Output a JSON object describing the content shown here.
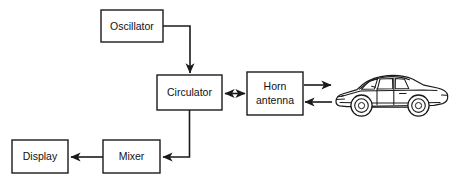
{
  "diagram": {
    "background_color": "#ffffff",
    "line_color": "#1a1a1a",
    "text_color": "#111111",
    "blocks": [
      {
        "id": "oscillator",
        "label": "Oscillator",
        "x": 101,
        "y": 10,
        "w": 62,
        "h": 32
      },
      {
        "id": "circulator",
        "label": "Circulator",
        "x": 157,
        "y": 75,
        "w": 65,
        "h": 35
      },
      {
        "id": "horn-antenna",
        "label_line1": "Horn",
        "label_line2": "antenna",
        "x": 247,
        "y": 72,
        "w": 56,
        "h": 43
      },
      {
        "id": "mixer",
        "label": "Mixer",
        "x": 103,
        "y": 140,
        "w": 57,
        "h": 33
      },
      {
        "id": "display",
        "label": "Display",
        "x": 12,
        "y": 140,
        "w": 56,
        "h": 33
      }
    ],
    "connections": [
      {
        "id": "oscillator-to-circulator",
        "from": "oscillator",
        "to": "circulator",
        "arrow": "single-down"
      },
      {
        "id": "circulator-to-horn-antenna",
        "from": "circulator",
        "to": "horn-antenna",
        "arrow": "double"
      },
      {
        "id": "horn-antenna-to-target",
        "from": "horn-antenna",
        "to": "target-vehicle",
        "arrow": "single-right"
      },
      {
        "id": "target-to-horn-antenna",
        "from": "target-vehicle",
        "to": "horn-antenna",
        "arrow": "single-left"
      },
      {
        "id": "circulator-to-mixer",
        "from": "circulator",
        "to": "mixer",
        "arrow": "single-left"
      },
      {
        "id": "mixer-to-display",
        "from": "mixer",
        "to": "display",
        "arrow": "single-left"
      }
    ],
    "target": {
      "id": "target-vehicle",
      "name": "car-illustration",
      "x": 330,
      "y": 66,
      "w": 118,
      "h": 52
    }
  }
}
